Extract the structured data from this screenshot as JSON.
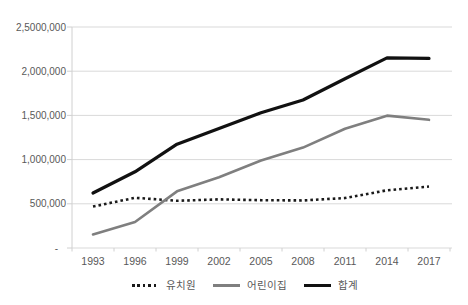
{
  "chart_data": {
    "type": "line",
    "title": "",
    "categories": [
      "1993",
      "1996",
      "1999",
      "2002",
      "2005",
      "2008",
      "2011",
      "2014",
      "2017"
    ],
    "series": [
      {
        "name": "유치원",
        "key": "kindergarten",
        "color": "#1a1a1a",
        "style": "dotted",
        "values": [
          469000,
          568000,
          534000,
          550000,
          541000,
          538000,
          565000,
          653000,
          695000
        ]
      },
      {
        "name": "어린이집",
        "key": "daycare",
        "color": "#7f7f7f",
        "style": "solid",
        "values": [
          153000,
          294000,
          641000,
          801000,
          989000,
          1136000,
          1349000,
          1497000,
          1450000
        ]
      },
      {
        "name": "합계",
        "key": "total",
        "color": "#111111",
        "style": "solid",
        "values": [
          622000,
          862000,
          1175000,
          1351000,
          1530000,
          1674000,
          1914000,
          2150000,
          2145000
        ]
      }
    ],
    "y_axis": {
      "min": 0,
      "max": 2500000,
      "tick_interval": 500000,
      "tick_labels": [
        "-",
        "500,000",
        "1,000,000",
        "1,500,000",
        "2,000,000",
        "2,5000,000"
      ]
    },
    "x_axis": {
      "tick_labels": [
        "1993",
        "1996",
        "1999",
        "2002",
        "2005",
        "2008",
        "2011",
        "2014",
        "2017"
      ]
    },
    "grid": true,
    "legend_position": "bottom",
    "colors": {
      "gridline": "#d9d9d9",
      "axis_line": "#d0d0d0",
      "axis_text": "#595959",
      "background": "#ffffff"
    }
  }
}
